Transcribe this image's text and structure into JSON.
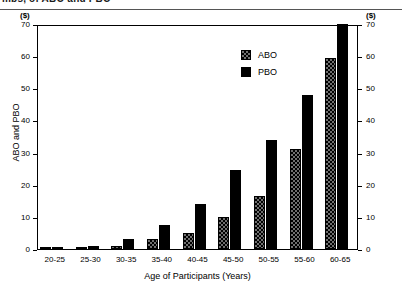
{
  "page_header": {
    "clipped_text": "mbs, of ABO and PBO"
  },
  "chart_data": {
    "type": "bar",
    "title": "",
    "subtitle": "",
    "xlabel": "Age of Participants (Years)",
    "ylabel": "ABO and PBO",
    "y_axis_unit_left": "($)",
    "y_axis_unit_right": "($)",
    "ylim": [
      0,
      70
    ],
    "yticks": [
      0,
      10,
      20,
      30,
      40,
      50,
      60,
      70
    ],
    "ytick_labels": [
      "0",
      "10",
      "20",
      "30",
      "40",
      "50",
      "60",
      "70"
    ],
    "grid": false,
    "dual_axis": true,
    "legend_position": "inside upper center-right",
    "categories": [
      "20-25",
      "25-30",
      "30-35",
      "35-40",
      "40-45",
      "45-50",
      "50-55",
      "55-60",
      "60-65"
    ],
    "series": [
      {
        "name": "ABO",
        "fill": "checkered",
        "color": "#6f6f6f",
        "values": [
          0,
          0.4,
          1,
          3,
          5,
          10,
          16.5,
          31,
          59.5
        ]
      },
      {
        "name": "PBO",
        "fill": "solid",
        "color": "#000000",
        "values": [
          0.3,
          1,
          3,
          7.5,
          14,
          24.5,
          34,
          48,
          70
        ]
      }
    ]
  }
}
